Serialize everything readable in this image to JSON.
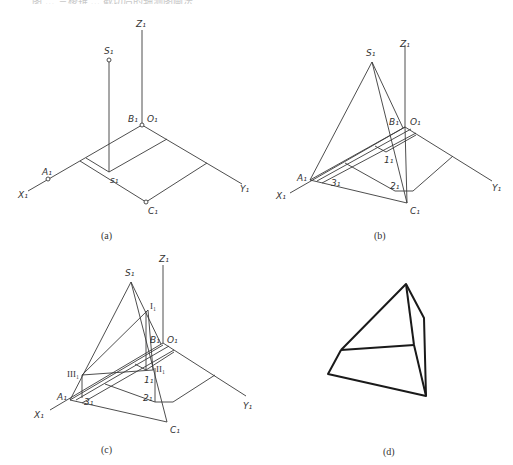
{
  "header": {
    "cutoff_text": "图 … 三棱锥 … 截切后的轴测图画法"
  },
  "panels": {
    "a": {
      "caption": "(a)",
      "labels": {
        "Z": "Z₁",
        "S": "S₁",
        "B": "B₁",
        "O": "O₁",
        "A": "A₁",
        "X": "X₁",
        "s": "s₁",
        "C": "C₁",
        "Y": "Y₁"
      }
    },
    "b": {
      "caption": "(b)",
      "labels": {
        "Z": "Z₁",
        "S": "S₁",
        "B": "B₁",
        "O": "O₁",
        "A": "A₁",
        "X": "X₁",
        "p1": "1₁",
        "p2": "2₁",
        "p3": "3₁",
        "C": "C₁",
        "Y": "Y₁"
      }
    },
    "c": {
      "caption": "(c)",
      "labels": {
        "Z": "Z₁",
        "S": "S₁",
        "I": "I₁",
        "II": "II₁",
        "III": "III₁",
        "B": "B₁",
        "O": "O₁",
        "A": "A₁",
        "X": "X₁",
        "p1": "1₁",
        "p2": "2₁",
        "p3": "3₁",
        "C": "C₁",
        "Y": "Y₁"
      }
    },
    "d": {
      "caption": "(d)"
    }
  },
  "colors": {
    "line": "#3a3a3a",
    "thick": "#1a1a1a",
    "background": "#ffffff"
  }
}
